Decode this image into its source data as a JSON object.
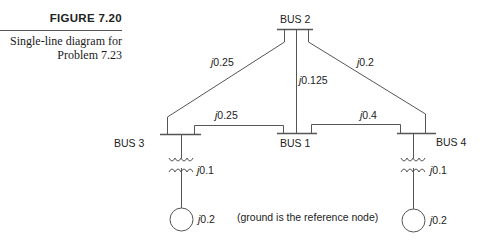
{
  "caption": {
    "figure_label": "FIGURE 7.20",
    "description_line1": "Single-line diagram for",
    "description_line2": "Problem 7.23"
  },
  "buses": {
    "bus1": "BUS 1",
    "bus2": "BUS 2",
    "bus3": "BUS 3",
    "bus4": "BUS 4"
  },
  "lines": {
    "bus2_bus3": {
      "j": "j",
      "value": "0.25"
    },
    "bus2_bus1": {
      "j": "j",
      "value": "0.125"
    },
    "bus2_bus4": {
      "j": "j",
      "value": "0.2"
    },
    "bus3_bus1": {
      "j": "j",
      "value": "0.25"
    },
    "bus1_bus4": {
      "j": "j",
      "value": "0.4"
    }
  },
  "transformers": {
    "bus3": {
      "j": "j",
      "value": "0.1"
    },
    "bus4": {
      "j": "j",
      "value": "0.1"
    }
  },
  "generators": {
    "bus3": {
      "j": "j",
      "value": "0.2"
    },
    "bus4": {
      "j": "j",
      "value": "0.2"
    }
  },
  "note": "(ground is the reference node)",
  "colors": {
    "line": "#555555",
    "text": "#222222",
    "rule": "#555555"
  }
}
